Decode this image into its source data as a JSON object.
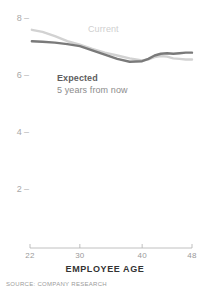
{
  "chart_data": {
    "type": "line",
    "title": "",
    "xlabel": "EMPLOYEE AGE",
    "ylabel": "",
    "xlim": [
      22,
      48
    ],
    "ylim": [
      1.3,
      8.3
    ],
    "grid": false,
    "legend_position": "inline-annotations",
    "source": "SOURCE: COMPANY RESEARCH",
    "x_ticks": [
      22,
      30,
      40,
      48
    ],
    "x_tick_labels": [
      "22",
      "30",
      "40",
      "48"
    ],
    "y_ticks": [
      8,
      6,
      4,
      2
    ],
    "y_tick_labels": [
      "8",
      "6",
      "4",
      "2"
    ],
    "series": [
      {
        "name": "Current",
        "color": "#d2d2d2",
        "label": "Current",
        "x": [
          22.3,
          24,
          26,
          28,
          30,
          32,
          34,
          36,
          38,
          40,
          41,
          42,
          43,
          44,
          45,
          46,
          47,
          48
        ],
        "values": [
          7.62,
          7.55,
          7.4,
          7.22,
          7.1,
          6.95,
          6.82,
          6.72,
          6.62,
          6.55,
          6.58,
          6.66,
          6.7,
          6.68,
          6.62,
          6.6,
          6.58,
          6.58
        ]
      },
      {
        "name": "Expected",
        "color": "#7a7a7a",
        "label": "Expected",
        "sublabel": "5 years from now",
        "x": [
          22.3,
          24,
          26,
          28,
          30,
          32,
          34,
          36,
          38,
          40,
          41,
          42,
          43,
          44,
          45,
          46,
          47,
          48
        ],
        "values": [
          7.22,
          7.2,
          7.17,
          7.12,
          7.05,
          6.9,
          6.75,
          6.6,
          6.5,
          6.52,
          6.6,
          6.72,
          6.78,
          6.8,
          6.78,
          6.8,
          6.82,
          6.82
        ]
      }
    ]
  },
  "axis": {
    "x_title": "EMPLOYEE AGE",
    "tick_dash": "–"
  },
  "footer": {
    "source": "SOURCE: COMPANY RESEARCH"
  }
}
